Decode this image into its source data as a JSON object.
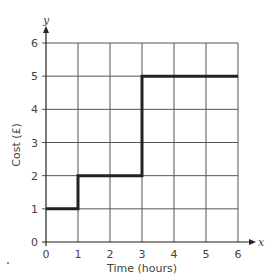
{
  "chart_data": {
    "type": "line",
    "subtype": "step",
    "title": "",
    "xlabel": "Time (hours)",
    "ylabel": "Cost (£)",
    "x_axis_var": "x",
    "y_axis_var": "y",
    "xlim": [
      0,
      6
    ],
    "ylim": [
      0,
      6
    ],
    "x_ticks": [
      0,
      1,
      2,
      3,
      4,
      5,
      6
    ],
    "y_ticks": [
      0,
      1,
      2,
      3,
      4,
      5,
      6
    ],
    "grid": true,
    "legend": null,
    "series": [
      {
        "name": "Cost",
        "points": [
          [
            0,
            1
          ],
          [
            1,
            1
          ],
          [
            1,
            2
          ],
          [
            3,
            2
          ],
          [
            3,
            5
          ],
          [
            6,
            5
          ]
        ],
        "segments": [
          {
            "x_start": 0,
            "x_end": 1,
            "y": 1
          },
          {
            "x_start": 1,
            "x_end": 3,
            "y": 2
          },
          {
            "x_start": 3,
            "x_end": 6,
            "y": 5
          }
        ],
        "color": "#222222"
      }
    ]
  },
  "colors": {
    "grid": "#555555",
    "axis": "#222222",
    "series": "#222222"
  }
}
